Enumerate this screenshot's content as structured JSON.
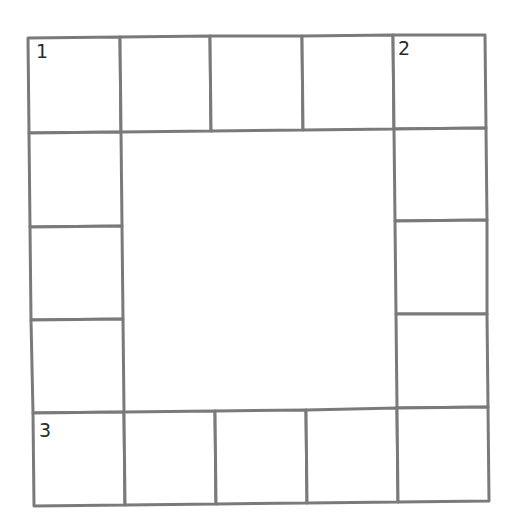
{
  "puzzle": {
    "type": "crossword-frame",
    "line_color": "#7a7a7a",
    "clue_numbers": [
      {
        "label": "1",
        "x": 36,
        "y": 58
      },
      {
        "label": "2",
        "x": 398,
        "y": 55
      },
      {
        "label": "3",
        "x": 39,
        "y": 437
      }
    ],
    "cells": {
      "top_row": [
        {
          "points": "28,38 120,37 121,132 29,133"
        },
        {
          "points": "120,37 210,36 211,131 121,132"
        },
        {
          "points": "210,36 302,36 303,130 211,131"
        },
        {
          "points": "302,36 393,35 394,129 303,130"
        },
        {
          "points": "393,35 485,35 486,128 394,129"
        }
      ],
      "left_column": [
        {
          "points": "29,133 121,132 122,226 30,227"
        },
        {
          "points": "30,227 122,226 123,319 31,320"
        },
        {
          "points": "31,320 123,319 124,412 33,413"
        }
      ],
      "right_column": [
        {
          "points": "394,129 486,128 487,220 395,221"
        },
        {
          "points": "395,221 487,220 487,314 396,314"
        },
        {
          "points": "396,314 487,314 488,407 397,408"
        }
      ],
      "bottom_row": [
        {
          "points": "33,413 124,412 125,505 34,506"
        },
        {
          "points": "124,412 215,411 216,504 125,505"
        },
        {
          "points": "215,411 306,410 307,503 216,504"
        },
        {
          "points": "306,410 397,408 398,502 307,503"
        },
        {
          "points": "397,408 488,407 489,501 398,502"
        }
      ]
    }
  }
}
